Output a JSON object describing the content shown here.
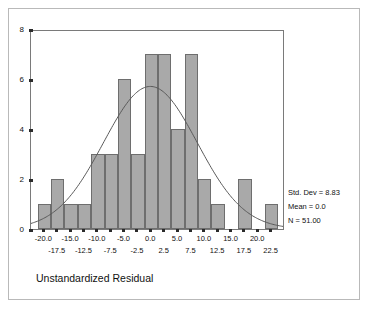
{
  "axis_title": "Unstandardized Residual",
  "stats": {
    "std_dev": "Std. Dev = 8.83",
    "mean": "Mean = 0.0",
    "n": "N = 51.00"
  },
  "colors": {
    "bar_fill": "#a9a9a9",
    "bar_edge": "#6e6e6e",
    "curve": "#5a5a5a",
    "axis": "#7a7a7a",
    "frame": "#b9b9b9",
    "text": "#111111"
  },
  "chart_data": {
    "type": "bar",
    "title": "",
    "subtitle": "",
    "xlabel": "Unstandardized Residual",
    "ylabel": "",
    "grid": false,
    "legend_position": "right",
    "xlim": [
      -22.5,
      25.0
    ],
    "ylim": [
      0,
      8
    ],
    "bin_width": 2.5,
    "x_tick_labels": [
      "-20.0",
      "-17.5",
      "-15.0",
      "-12.5",
      "-10.0",
      "-7.5",
      "-5.0",
      "-2.5",
      "0.0",
      "2.5",
      "5.0",
      "7.5",
      "10.0",
      "12.5",
      "15.0",
      "17.5",
      "20.0",
      "22.5"
    ],
    "x_tick_values": [
      -20.0,
      -17.5,
      -15.0,
      -12.5,
      -10.0,
      -7.5,
      -5.0,
      -2.5,
      0.0,
      2.5,
      5.0,
      7.5,
      10.0,
      12.5,
      15.0,
      17.5,
      20.0,
      22.5
    ],
    "y_tick_labels": [
      "0",
      "2",
      "4",
      "6",
      "8"
    ],
    "y_tick_values": [
      0,
      2,
      4,
      6,
      8
    ],
    "categories": [
      "-20.0",
      "-17.5",
      "-15.0",
      "-12.5",
      "-10.0",
      "-7.5",
      "-5.0",
      "-2.5",
      "0.0",
      "2.5",
      "5.0",
      "7.5",
      "10.0",
      "12.5",
      "15.0",
      "17.5",
      "20.0",
      "22.5"
    ],
    "bin_centers": [
      -20.0,
      -17.5,
      -15.0,
      -12.5,
      -10.0,
      -7.5,
      -5.0,
      -2.5,
      0.0,
      2.5,
      5.0,
      7.5,
      10.0,
      12.5,
      15.0,
      17.5,
      20.0,
      22.5
    ],
    "values": [
      1,
      2,
      1,
      1,
      3,
      3,
      6,
      3,
      7,
      7,
      4,
      7,
      2,
      1,
      0,
      2,
      0,
      1
    ],
    "normal_curve": {
      "mean": 0.0,
      "std_dev": 8.83,
      "n": 51,
      "peak_value": 5.77
    },
    "annotations": [
      "Std. Dev = 8.83",
      "Mean = 0.0",
      "N = 51.00"
    ]
  }
}
